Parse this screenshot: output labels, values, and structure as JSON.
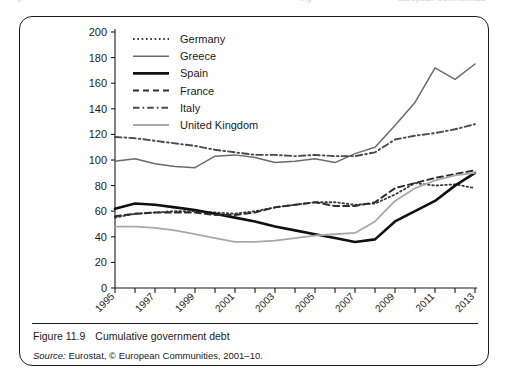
{
  "page_bleed": {
    "left": "p",
    "middle": "ing",
    "right": "European Communities"
  },
  "figure": {
    "number_label": "Figure 11.9",
    "caption": "Cumulative government debt",
    "source_label": "Source:",
    "source_text": " Eurostat, © European Communities, 2001–10."
  },
  "chart_data": {
    "type": "line",
    "title": "Cumulative government debt",
    "xlabel": "",
    "ylabel": "",
    "ylim": [
      0,
      200
    ],
    "ytick_step": 20,
    "yticks": [
      0,
      20,
      40,
      60,
      80,
      100,
      120,
      140,
      160,
      180,
      200
    ],
    "grid": false,
    "legend_position": "top-left-inside",
    "x": [
      1995,
      1996,
      1997,
      1998,
      1999,
      2000,
      2001,
      2002,
      2003,
      2004,
      2005,
      2006,
      2007,
      2008,
      2009,
      2010,
      2011,
      2012,
      2013
    ],
    "xtick_labels": [
      "1995",
      "",
      "1997",
      "",
      "1999",
      "",
      "2001",
      "",
      "2003",
      "",
      "2005",
      "",
      "2007",
      "",
      "2009",
      "",
      "2011",
      "",
      "2013"
    ],
    "xlim": [
      1995,
      2013
    ],
    "series": [
      {
        "name": "Germany",
        "style": "dotted",
        "color": "#3a3a3a",
        "width": 1.8,
        "values": [
          55,
          58,
          59,
          60,
          60,
          59,
          58,
          60,
          63,
          65,
          67,
          67,
          65,
          66,
          73,
          82,
          80,
          81,
          78
        ]
      },
      {
        "name": "Greece",
        "style": "solid",
        "color": "#6b6b6b",
        "width": 1.5,
        "values": [
          99,
          101,
          97,
          95,
          94,
          103,
          104,
          102,
          98,
          99,
          101,
          98,
          105,
          110,
          127,
          145,
          172,
          163,
          175
        ]
      },
      {
        "name": "Spain",
        "style": "solid",
        "color": "#101010",
        "width": 2.6,
        "values": [
          62,
          66,
          65,
          63,
          61,
          58,
          55,
          52,
          48,
          45,
          42,
          39,
          36,
          38,
          52,
          60,
          68,
          80,
          90
        ]
      },
      {
        "name": "France",
        "style": "dashed",
        "color": "#2d2d2d",
        "width": 2.0,
        "values": [
          56,
          58,
          59,
          59,
          59,
          57,
          57,
          59,
          63,
          65,
          67,
          64,
          64,
          67,
          78,
          82,
          86,
          89,
          92
        ]
      },
      {
        "name": "Italy",
        "style": "dashdot",
        "color": "#4a4a4a",
        "width": 1.9,
        "values": [
          118,
          117,
          115,
          113,
          111,
          108,
          106,
          104,
          104,
          103,
          104,
          103,
          103,
          106,
          116,
          119,
          121,
          124,
          128
        ]
      },
      {
        "name": "United Kingdom",
        "style": "solid",
        "color": "#a8a8a8",
        "width": 1.8,
        "values": [
          48,
          48,
          47,
          45,
          42,
          39,
          36,
          36,
          37,
          39,
          41,
          42,
          43,
          52,
          68,
          78,
          84,
          88,
          90
        ]
      }
    ]
  }
}
